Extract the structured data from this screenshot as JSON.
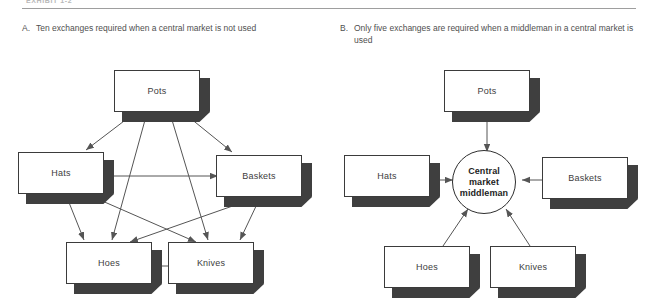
{
  "exhibit": {
    "label": "EXHIBIT 1-2"
  },
  "panels": [
    {
      "letter": "A.",
      "caption": "Ten exchanges required when a central market is not used",
      "nodes": [
        {
          "id": "pots",
          "label": "Pots"
        },
        {
          "id": "hats",
          "label": "Hats"
        },
        {
          "id": "baskets",
          "label": "Baskets"
        },
        {
          "id": "hoes",
          "label": "Hoes"
        },
        {
          "id": "knives",
          "label": "Knives"
        }
      ],
      "exchange_count": 10,
      "edges": [
        "pots-hats",
        "pots-baskets",
        "pots-hoes",
        "pots-knives",
        "hats-baskets",
        "hats-hoes",
        "hats-knives",
        "baskets-hoes",
        "baskets-knives",
        "hoes-knives"
      ]
    },
    {
      "letter": "B.",
      "caption": "Only five exchanges are required when a middleman in a central market is used",
      "center": {
        "line1": "Central",
        "line2": "market",
        "line3": "middleman"
      },
      "nodes": [
        {
          "id": "pots",
          "label": "Pots"
        },
        {
          "id": "hats",
          "label": "Hats"
        },
        {
          "id": "baskets",
          "label": "Baskets"
        },
        {
          "id": "hoes",
          "label": "Hoes"
        },
        {
          "id": "knives",
          "label": "Knives"
        }
      ],
      "exchange_count": 5,
      "edges": [
        "pots-center",
        "hats-center",
        "baskets-center",
        "hoes-center",
        "knives-center"
      ]
    }
  ],
  "colors": {
    "box_face": "#ffffff",
    "box_outline": "#3b3b3b",
    "box_shadow": "#3f3f3f",
    "arrow": "#555555",
    "rule": "#9e9e9e",
    "text": "#4a4a4a",
    "crescent": "#6f6f6f"
  }
}
